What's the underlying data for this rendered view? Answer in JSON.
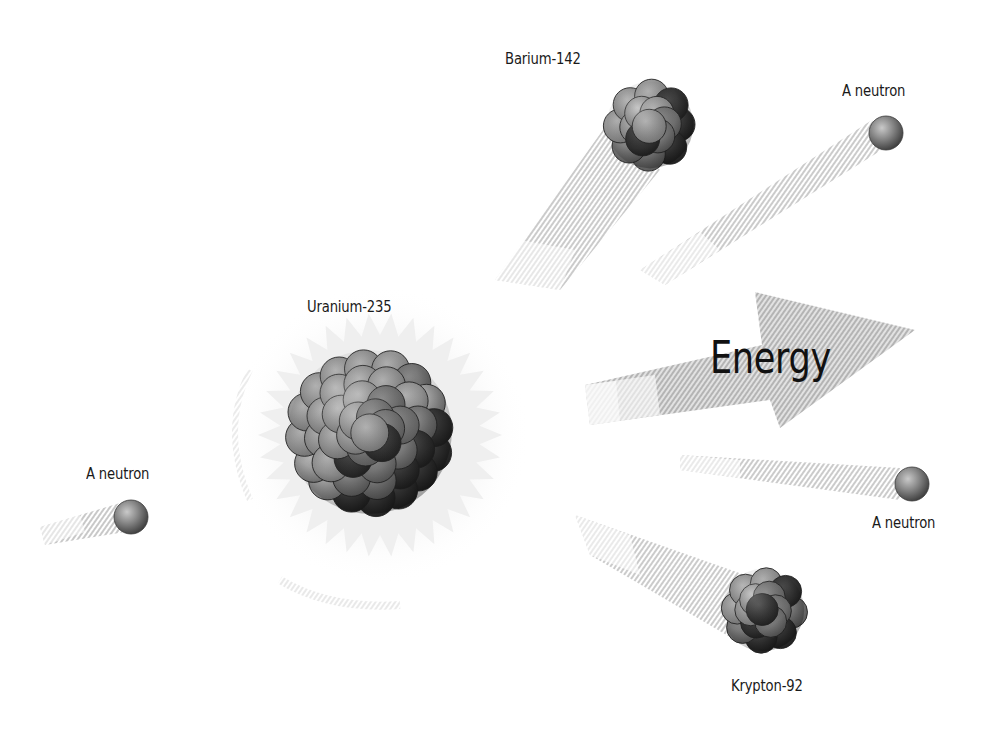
{
  "diagram": {
    "labels": {
      "uranium": "Uranium-235",
      "barium": "Barium-142",
      "krypton": "Krypton-92",
      "neutron_incoming": "A neutron",
      "neutron_top_right": "A neutron",
      "neutron_mid_right": "A neutron",
      "energy": "Energy"
    },
    "particles": [
      {
        "id": "incoming-neutron",
        "type": "neutron",
        "cx": 131,
        "cy": 517,
        "r": 17
      },
      {
        "id": "uranium-235",
        "type": "nucleus",
        "cx": 370,
        "cy": 430,
        "r": 92
      },
      {
        "id": "barium-142",
        "type": "nucleus",
        "cx": 650,
        "cy": 125,
        "r": 55
      },
      {
        "id": "krypton-92",
        "type": "nucleus",
        "cx": 763,
        "cy": 610,
        "r": 53
      },
      {
        "id": "neutron-top-right",
        "type": "neutron",
        "cx": 886,
        "cy": 133,
        "r": 17
      },
      {
        "id": "neutron-mid-right",
        "type": "neutron",
        "cx": 912,
        "cy": 484,
        "r": 17
      }
    ],
    "colors": {
      "background": "#ffffff",
      "nucleon_light": "#9a9a9a",
      "nucleon_mid": "#6e6e6e",
      "nucleon_dark": "#2e2e2e",
      "trail": "#c8c8c8",
      "arrow": "#bdbdbd",
      "text": "#1a1a1a"
    }
  }
}
